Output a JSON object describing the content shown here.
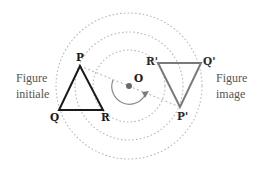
{
  "diagram": {
    "center": {
      "label": "O",
      "x": 129,
      "y": 86
    },
    "circles": [
      {
        "name": "inner",
        "r": 36
      },
      {
        "name": "middle",
        "r": 54
      },
      {
        "name": "outer",
        "r": 73
      }
    ],
    "initial_figure": {
      "caption_line1": "Figure",
      "caption_line2": "initiale",
      "points": [
        {
          "label": "P",
          "x": 80,
          "y": 66
        },
        {
          "label": "Q",
          "x": 59,
          "y": 110
        },
        {
          "label": "R",
          "x": 103,
          "y": 110
        }
      ]
    },
    "image_figure": {
      "caption_line1": "Figure",
      "caption_line2": "image",
      "points": [
        {
          "label": "P'",
          "x": 180,
          "y": 107
        },
        {
          "label": "Q'",
          "x": 201,
          "y": 63
        },
        {
          "label": "R'",
          "x": 158,
          "y": 63
        }
      ]
    },
    "colors": {
      "initial": "#1a1a1a",
      "image": "#7a7a7a",
      "circles": "#b8b8b8"
    }
  }
}
